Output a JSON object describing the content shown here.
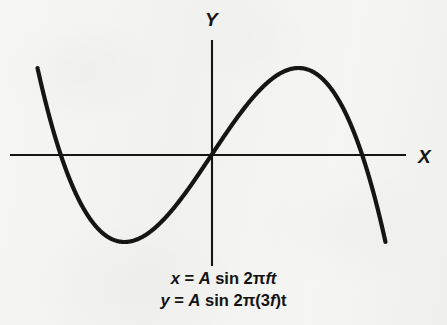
{
  "figure": {
    "type": "lissajous-curve",
    "background_color": "#f4f4f2",
    "ink_color": "#151515",
    "axes": {
      "x_label": "X",
      "y_label": "Y",
      "x_axis_y_px": 155,
      "x_axis_x_start_px": 10,
      "x_axis_x_end_px": 406,
      "y_axis_x_px": 212,
      "y_axis_y_start_px": 40,
      "y_axis_y_end_px": 266
    },
    "curve": {
      "stroke_width_px": 4.2,
      "x_amplitude_px": 174,
      "y_amplitude_px": 87,
      "center_x_px": 211.5,
      "center_y_px": 155,
      "frequency_ratio": "1:3",
      "lobes": 3,
      "node_crossings_px": [
        [
          147,
          155
        ],
        [
          277,
          155
        ]
      ],
      "left_extent_px": 38,
      "right_extent_px": 385,
      "top_extent_px": 68,
      "bottom_extent_px": 243
    }
  },
  "equations": {
    "line1": {
      "lhs": "x",
      "equals": " = ",
      "amplitude": "A",
      "func": " sin 2",
      "pi": "π",
      "freq": "ft"
    },
    "line2": {
      "lhs": "y",
      "equals": " = ",
      "amplitude": "A",
      "func": " sin 2",
      "pi": "π",
      "open_paren": "(3",
      "freq_symbol": "f",
      "close_paren": ")",
      "time": "t"
    },
    "line1_plain": "x = A sin 2πft",
    "line2_plain": "y = A sin 2π(3f)t"
  },
  "chart_data": {
    "type": "line",
    "title": "",
    "subtitle": "",
    "xlabel": "X",
    "ylabel": "Y",
    "annotations": [
      "x = A sin 2πft",
      "y = A sin 2π(3f)t"
    ],
    "grid": false,
    "legend": "none",
    "xlim": [
      -1.15,
      1.15
    ],
    "ylim": [
      -1.25,
      1.25
    ],
    "parametric": {
      "x_expression": "A*sin(2*pi*f*t)",
      "y_expression": "A*sin(2*pi*(3*f)*t)",
      "amplitude_A": 1,
      "x_frequency_multiple": 1,
      "y_frequency_multiple": 3,
      "phase_difference_rad": 0,
      "t_range_periods": 1,
      "lobe_count": 3,
      "self_intersections": 2
    },
    "series": [
      {
        "name": "Lissajous 1:3",
        "x": [
          0.0,
          0.208,
          0.407,
          0.588,
          0.743,
          0.866,
          0.951,
          0.995,
          0.995,
          0.951,
          0.866,
          0.743,
          0.588,
          0.407,
          0.208,
          0.0,
          -0.208,
          -0.407,
          -0.588,
          -0.743,
          -0.866,
          -0.951,
          -0.995,
          -0.995,
          -0.951,
          -0.866,
          -0.743,
          -0.588,
          -0.407,
          -0.208,
          0.0
        ],
        "y": [
          0.0,
          0.588,
          0.951,
          0.951,
          0.588,
          0.0,
          -0.588,
          -0.951,
          -0.951,
          -0.588,
          0.0,
          0.588,
          0.951,
          0.951,
          0.588,
          0.0,
          -0.588,
          -0.951,
          -0.951,
          -0.588,
          0.0,
          0.588,
          0.951,
          0.951,
          0.588,
          0.0,
          -0.588,
          -0.951,
          -0.951,
          -0.588,
          0.0
        ]
      }
    ]
  }
}
